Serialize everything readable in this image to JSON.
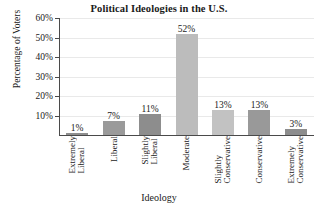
{
  "chart_data": {
    "type": "bar",
    "title": "Political Ideologies in the U.S.",
    "xlabel": "Ideology",
    "ylabel": "Percentage of Voters",
    "categories": [
      "Extremely Liberal",
      "Liberal",
      "Slightly Liberal",
      "Moderate",
      "Slightly Conservative",
      "Conservative",
      "Extremely Conservative"
    ],
    "category_lines": [
      [
        "Extremely",
        "Liberal"
      ],
      [
        "Liberal"
      ],
      [
        "Slightly",
        "Liberal"
      ],
      [
        "Moderate"
      ],
      [
        "Slightly",
        "Conservative"
      ],
      [
        "Conservative"
      ],
      [
        "Extremely",
        "Conservative"
      ]
    ],
    "values": [
      1,
      7,
      11,
      52,
      13,
      13,
      3
    ],
    "value_labels": [
      "1%",
      "7%",
      "11%",
      "52%",
      "13%",
      "13%",
      "3%"
    ],
    "bar_colors": [
      "#8f8f8f",
      "#9a9a9a",
      "#8d8d8d",
      "#bcbcbc",
      "#c2c2c2",
      "#999999",
      "#8d8d8d"
    ],
    "ylim": [
      0,
      60
    ],
    "yticks": [
      10,
      20,
      30,
      40,
      50,
      60
    ],
    "ytick_labels": [
      "10%",
      "20%",
      "30%",
      "40%",
      "50%",
      "60%"
    ],
    "grid": true,
    "legend": "none",
    "axis_color": "#4a4a4a",
    "gridline_color": "#e9e9e9",
    "background": "#ffffff"
  }
}
